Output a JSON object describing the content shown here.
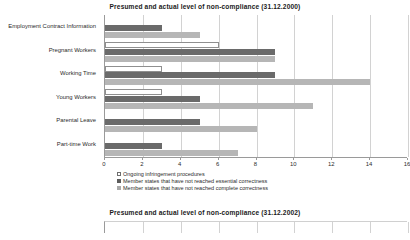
{
  "charts": [
    {
      "title": "Presumed and actual level of non-compliance (31.12.2000)",
      "legend": [
        {
          "label": "Ongoing infringement procedures",
          "swatch": "s0"
        },
        {
          "label": "Member states that have not reached essential correctness",
          "swatch": "s1"
        },
        {
          "label": "Member states that have not reached complete correctness",
          "swatch": "s2"
        }
      ],
      "ticks": [
        "0",
        "2",
        "4",
        "6",
        "8",
        "10",
        "12",
        "14",
        "16"
      ],
      "categories": [
        "Employment Contract Information",
        "Pregnant Workers",
        "Working Time",
        "Young Workers",
        "Parental Leave",
        "Part-time Work"
      ]
    },
    {
      "title": "Presumed and actual level of non-compliance (31.12.2002)",
      "legend": [],
      "ticks": [],
      "categories": []
    }
  ],
  "chart_data": [
    {
      "type": "bar",
      "orientation": "horizontal",
      "title": "Presumed and actual level of non-compliance (31.12.2000)",
      "xlabel": "",
      "ylabel": "",
      "xlim": [
        0,
        16
      ],
      "xticks": [
        0,
        2,
        4,
        6,
        8,
        10,
        12,
        14,
        16
      ],
      "grid": true,
      "legend_position": "bottom",
      "categories": [
        "Employment Contract Information",
        "Pregnant Workers",
        "Working Time",
        "Young Workers",
        "Parental Leave",
        "Part-time Work"
      ],
      "series": [
        {
          "name": "Ongoing infringement procedures",
          "color": "#ffffff",
          "values": [
            0,
            6,
            3,
            3,
            0,
            0
          ]
        },
        {
          "name": "Member states that have not reached essential correctness",
          "color": "#6a6a6a",
          "values": [
            3,
            9,
            9,
            5,
            5,
            3
          ]
        },
        {
          "name": "Member states that have not reached complete correctness",
          "color": "#b6b6b6",
          "values": [
            5,
            9,
            14,
            11,
            8,
            7
          ]
        }
      ]
    },
    {
      "type": "bar",
      "orientation": "horizontal",
      "title": "Presumed and actual level of non-compliance (31.12.2002)",
      "xlabel": "",
      "ylabel": "",
      "grid": true,
      "categories": [],
      "series": [],
      "note": "second chart cropped at bottom edge of screenshot; only title and top of plot frame visible"
    }
  ]
}
